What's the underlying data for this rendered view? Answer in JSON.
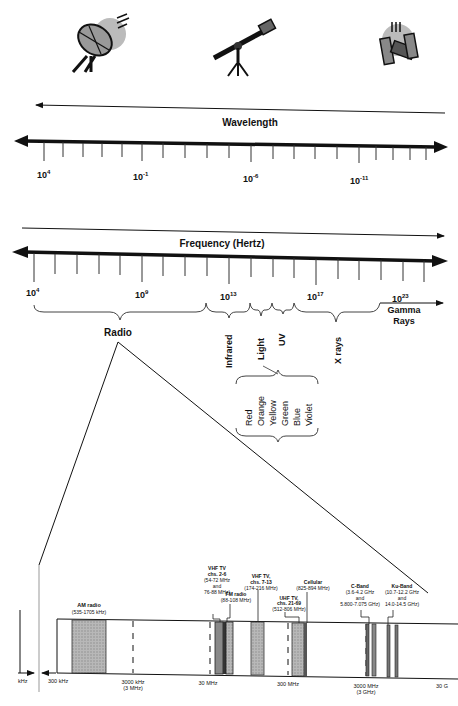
{
  "icons": {
    "left": "satellite-dish-icon",
    "center": "telescope-icon",
    "right": "xray-satellite-icon"
  },
  "wavelength": {
    "title": "Wavelength",
    "labels": [
      {
        "base": "10",
        "exp": "4"
      },
      {
        "base": "10",
        "exp": "-1"
      },
      {
        "base": "10",
        "exp": "-6"
      },
      {
        "base": "10",
        "exp": "-11"
      }
    ]
  },
  "frequency": {
    "title": "Frequency (Hertz)",
    "labels": [
      {
        "base": "10",
        "exp": "4"
      },
      {
        "base": "10",
        "exp": "9"
      },
      {
        "base": "10",
        "exp": "13"
      },
      {
        "base": "10",
        "exp": "17"
      },
      {
        "base": "10",
        "exp": "23"
      }
    ]
  },
  "regions": {
    "radio": "Radio",
    "infrared": "Infrared",
    "light": "Light",
    "uv": "UV",
    "xrays": "X rays",
    "gamma_line1": "Gamma",
    "gamma_line2": "Rays"
  },
  "colors": [
    "Red",
    "Orange",
    "Yellow",
    "Green",
    "Blue",
    "Violet"
  ],
  "radio_detail": {
    "bands": {
      "am": {
        "name": "AM radio",
        "range": "(535-1705 kHz)"
      },
      "vhf_low": {
        "name1": "VHF TV",
        "name2": "chs. 2-6",
        "range1": "(54-72 MHz",
        "range2": "and",
        "range3": "76-88 MHz)"
      },
      "fm": {
        "name": "FM radio",
        "range": "(88-108 MHz)"
      },
      "vhf_high": {
        "name1": "VHF TV,",
        "name2": "chs. 7-13",
        "range": "(174-216 MHz)"
      },
      "uhf": {
        "name1": "UHF TV,",
        "name2": "chs. 21-69",
        "range": "(512-806 MHz)"
      },
      "cellular": {
        "name": "Cellular",
        "range": "(825-894 MHz)"
      },
      "cband": {
        "name": "C-Band",
        "range1": "(3.6-4.2 GHz",
        "range2": "and",
        "range3": "5.800-7.075 GHz)"
      },
      "kuband": {
        "name": "Ku-Band",
        "range1": "(10.7-12.2 GHz",
        "range2": "and",
        "range3": "14.0-14.5 GHz)"
      }
    },
    "axis": {
      "left_partial": "kHz",
      "t300khz": "300 kHz",
      "t3000khz": "3000 kHz",
      "t3000khz_sub": "(3 MHz)",
      "t30mhz": "30 MHz",
      "t300mhz": "300 MHz",
      "t3000mhz": "3000 MHz",
      "t3000mhz_sub": "(3 GHz)",
      "t30g_partial": "30 G"
    }
  }
}
